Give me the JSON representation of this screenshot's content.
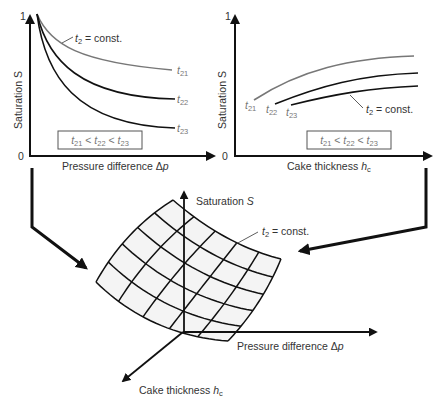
{
  "left_chart": {
    "y_axis_label": "Saturation S",
    "y_tick_top": "1",
    "y_tick_bottom": "0",
    "x_axis_label": "Pressure difference Δp",
    "annotation": "t2 = const.",
    "legend_box": "t21 < t22 < t23",
    "curve_labels": [
      "t21",
      "t22",
      "t23"
    ]
  },
  "right_chart": {
    "y_axis_label": "Saturation S",
    "y_tick_top": "1",
    "y_tick_bottom": "0",
    "x_axis_label": "Cake thickness hc",
    "annotation": "t2 = const.",
    "legend_box": "t21 < t22 < t23",
    "curve_labels": [
      "t21",
      "t22",
      "t23"
    ]
  },
  "surface_3d": {
    "z_axis_label": "Saturation S",
    "x_axis_label": "Pressure difference Δp",
    "y_axis_label": "Cake thickness hc",
    "annotation": "t2 = const."
  },
  "chart_data": [
    {
      "type": "line",
      "title": "",
      "xlabel": "Pressure difference Δp",
      "ylabel": "Saturation S",
      "ylim": [
        0,
        1
      ],
      "grid": false,
      "annotations": [
        "t2 = const.",
        "t21 < t22 < t23"
      ],
      "x": [
        0,
        0.1,
        0.2,
        0.35,
        0.5,
        0.7,
        0.85,
        1.0
      ],
      "series": [
        {
          "name": "t21",
          "color": "#777777",
          "values": [
            1.0,
            0.82,
            0.73,
            0.66,
            0.63,
            0.61,
            0.6,
            0.6
          ]
        },
        {
          "name": "t22",
          "color": "#111111",
          "values": [
            1.0,
            0.74,
            0.61,
            0.52,
            0.46,
            0.42,
            0.41,
            0.4
          ]
        },
        {
          "name": "t23",
          "color": "#111111",
          "values": [
            1.0,
            0.65,
            0.48,
            0.36,
            0.29,
            0.24,
            0.21,
            0.2
          ]
        }
      ]
    },
    {
      "type": "line",
      "title": "",
      "xlabel": "Cake thickness hc",
      "ylabel": "Saturation S",
      "ylim": [
        0,
        1
      ],
      "grid": false,
      "annotations": [
        "t2 = const.",
        "t21 < t22 < t23"
      ],
      "series": [
        {
          "name": "t21",
          "color": "#777777",
          "x": [
            0.1,
            0.3,
            0.5,
            0.7,
            0.9
          ],
          "values": [
            0.39,
            0.52,
            0.61,
            0.66,
            0.69
          ]
        },
        {
          "name": "t22",
          "color": "#111111",
          "x": [
            0.21,
            0.4,
            0.6,
            0.8,
            0.92
          ],
          "values": [
            0.36,
            0.45,
            0.52,
            0.56,
            0.58
          ]
        },
        {
          "name": "t23",
          "color": "#111111",
          "x": [
            0.29,
            0.45,
            0.65,
            0.8,
            0.92
          ],
          "values": [
            0.35,
            0.4,
            0.45,
            0.48,
            0.49
          ]
        }
      ]
    }
  ]
}
